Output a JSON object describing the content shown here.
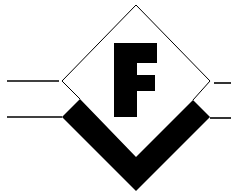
{
  "logo": {
    "letter": "F",
    "colors": {
      "ink": "#000000",
      "background": "#ffffff"
    }
  }
}
